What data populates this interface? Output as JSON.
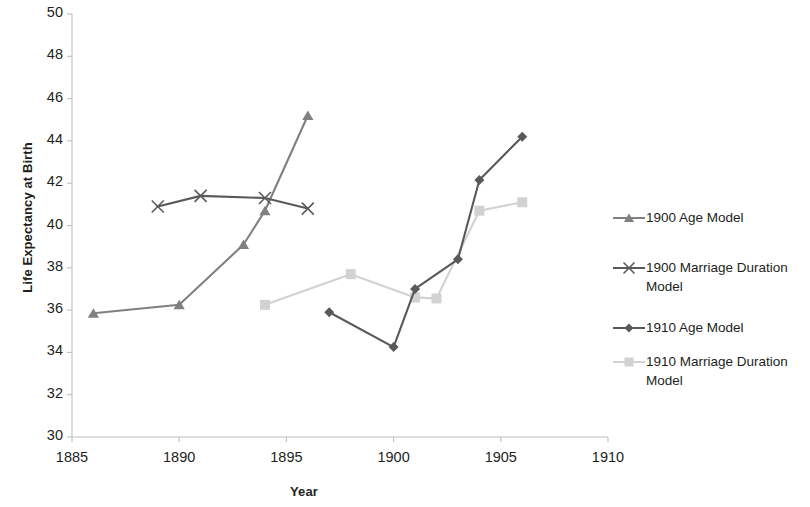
{
  "chart_data": {
    "type": "line",
    "title": "",
    "xlabel": "Year",
    "ylabel": "Life Expectancy at Birth",
    "xlim": [
      1885,
      1910
    ],
    "ylim": [
      30,
      50
    ],
    "xticks": [
      1885,
      1890,
      1895,
      1900,
      1905,
      1910
    ],
    "yticks": [
      30,
      32,
      34,
      36,
      38,
      40,
      42,
      44,
      46,
      48,
      50
    ],
    "grid": false,
    "legend_position": "right",
    "series": [
      {
        "name": "1900 Age Model",
        "marker": "triangle",
        "color": "#808080",
        "x": [
          1886,
          1890,
          1893,
          1894,
          1896
        ],
        "values": [
          35.85,
          36.25,
          39.1,
          40.7,
          45.2
        ]
      },
      {
        "name": "1900 Marriage Duration Model",
        "marker": "x",
        "color": "#5a5a5a",
        "x": [
          1889,
          1891,
          1894,
          1896
        ],
        "values": [
          40.9,
          41.4,
          41.3,
          40.8
        ]
      },
      {
        "name": "1910 Age Model",
        "marker": "diamond",
        "color": "#595959",
        "x": [
          1897,
          1900,
          1901,
          1903,
          1904,
          1906
        ],
        "values": [
          35.9,
          34.25,
          37.0,
          38.4,
          42.15,
          44.2
        ]
      },
      {
        "name": "1910 Marriage Duration Model",
        "marker": "square",
        "color": "#d2d2d2",
        "x": [
          1894,
          1898,
          1901,
          1902,
          1904,
          1906
        ],
        "values": [
          36.25,
          37.7,
          36.6,
          36.55,
          40.7,
          41.1
        ]
      }
    ]
  },
  "axis": {
    "x_title": "Year",
    "y_title": "Life Expectancy at Birth",
    "x_tick_labels": [
      "1885",
      "1890",
      "1895",
      "1900",
      "1905",
      "1910"
    ],
    "y_tick_labels": [
      "50",
      "48",
      "46",
      "44",
      "42",
      "40",
      "38",
      "36",
      "34",
      "32",
      "30"
    ]
  },
  "legend": {
    "items": [
      {
        "label": "1900 Age Model"
      },
      {
        "label": "1900 Marriage Duration\nModel"
      },
      {
        "label": "1910 Age Model"
      },
      {
        "label": "1910 Marriage Duration\nModel"
      }
    ]
  }
}
